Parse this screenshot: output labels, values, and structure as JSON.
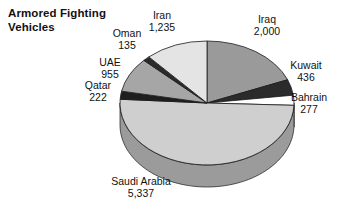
{
  "chart": {
    "title": "Armored Fighting\nVehicles",
    "background": "#ffffff",
    "text_color": "#111111"
  },
  "chart_data": {
    "type": "pie",
    "title": "Armored Fighting Vehicles",
    "xlabel": "",
    "ylabel": "",
    "total": 10597,
    "start_angle_deg": 0,
    "direction": "clockwise",
    "three_d": true,
    "legend": "none (direct labels)",
    "categories": [
      "Iraq",
      "Kuwait",
      "Bahrain",
      "Saudi Arabia",
      "Qatar",
      "UAE",
      "Oman",
      "Iran"
    ],
    "values": [
      2000,
      436,
      277,
      5337,
      222,
      955,
      135,
      1235
    ],
    "labels": [
      "2,000",
      "436",
      "277",
      "5,337",
      "222",
      "955",
      "135",
      "1,235"
    ],
    "colors": [
      "#9a9a9a",
      "#2b2b2b",
      "#ffffff",
      "#cfcfcf",
      "#1e1e1e",
      "#a6a6a6",
      "#2b2b2b",
      "#e4e4e4"
    ],
    "side_colors": [
      "#6e6e6e",
      "#1a1a1a",
      "#bdbdbd",
      "#9b9b9b",
      "#121212",
      "#777777",
      "#1a1a1a",
      "#b4b4b4"
    ],
    "slices": [
      {
        "name": "Iraq",
        "value": 2000,
        "label": "2,000",
        "color": "#9a9a9a"
      },
      {
        "name": "Kuwait",
        "value": 436,
        "label": "436",
        "color": "#2b2b2b"
      },
      {
        "name": "Bahrain",
        "value": 277,
        "label": "277",
        "color": "#ffffff"
      },
      {
        "name": "Saudi Arabia",
        "value": 5337,
        "label": "5,337",
        "color": "#cfcfcf"
      },
      {
        "name": "Qatar",
        "value": 222,
        "label": "222",
        "color": "#1e1e1e"
      },
      {
        "name": "UAE",
        "value": 955,
        "label": "955",
        "color": "#a6a6a6"
      },
      {
        "name": "Oman",
        "value": 135,
        "label": "135",
        "color": "#2b2b2b"
      },
      {
        "name": "Iran",
        "value": 1235,
        "label": "1,235",
        "color": "#e4e4e4"
      }
    ]
  },
  "labels": {
    "iran": {
      "name": "Iran",
      "value": "1,235"
    },
    "iraq": {
      "name": "Iraq",
      "value": "2,000"
    },
    "oman": {
      "name": "Oman",
      "value": "135"
    },
    "uae": {
      "name": "UAE",
      "value": "955"
    },
    "qatar": {
      "name": "Qatar",
      "value": "222"
    },
    "kuwait": {
      "name": "Kuwait",
      "value": "436"
    },
    "bahrain": {
      "name": "Bahrain",
      "value": "277"
    },
    "saudi": {
      "name": "Saudi Arabia",
      "value": "5,337"
    }
  }
}
